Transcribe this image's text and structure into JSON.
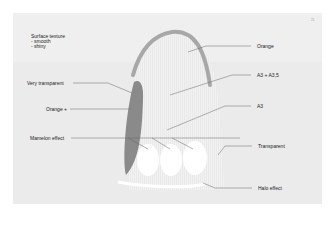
{
  "page_number": "21",
  "texture_note": {
    "title": "Surface texture",
    "items": [
      "- smooth",
      "- shiny"
    ]
  },
  "labels": {
    "very_transparent": "Very transparent",
    "orange_plus": "Orange +",
    "mamelon_effect": "Mamelon effect",
    "orange": "Orange",
    "a3_a35": "A3 + A3,5",
    "a3": "A3",
    "transparent": "Transparent",
    "halo_effect": "Halo effect"
  },
  "colors": {
    "panel": "#ebebeb",
    "tooth_body": "#f4f4f4",
    "enamel_edge": "#a8a8a8",
    "dark_layer": "#8a8a8a",
    "mamelon": "#ffffff"
  }
}
